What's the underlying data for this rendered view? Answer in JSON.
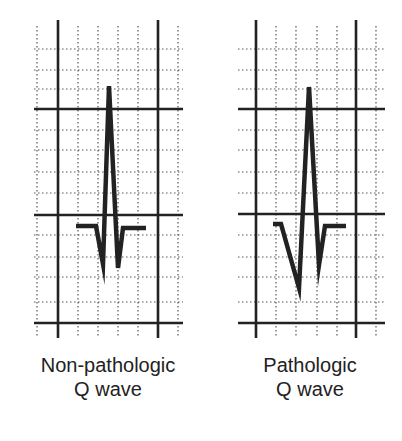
{
  "figure": {
    "colors": {
      "line": "#222222",
      "grid": "#555555",
      "background": "#ffffff"
    },
    "panels": [
      {
        "id": "non-pathologic",
        "label_line1": "Non-pathologic",
        "label_line2": "Q wave",
        "grid": {
          "thick_vertical_x": [
            58,
            158
          ],
          "thick_horizontal_y": [
            109,
            215,
            323
          ],
          "dotted_vertical_x": [
            37,
            78,
            98,
            118,
            138,
            178
          ],
          "dotted_horizontal_y": [
            49,
            70,
            89,
            130,
            150,
            172,
            193,
            235,
            257,
            277,
            302
          ],
          "x_range": [
            34,
            183
          ],
          "y_range": [
            20,
            338
          ]
        },
        "waveform": [
          [
            76,
            226
          ],
          [
            96,
            226
          ],
          [
            103,
            264
          ],
          [
            109,
            86
          ],
          [
            118,
            268
          ],
          [
            123,
            228
          ],
          [
            146,
            228
          ]
        ]
      },
      {
        "id": "pathologic",
        "label_line1": "Pathologic",
        "label_line2": "Q wave",
        "grid": {
          "thick_vertical_x": [
            256,
            356
          ],
          "thick_horizontal_y": [
            109,
            214,
            323
          ],
          "dotted_vertical_x": [
            276,
            296,
            317,
            337,
            376
          ],
          "dotted_horizontal_y": [
            49,
            70,
            89,
            130,
            150,
            172,
            193,
            235,
            257,
            277,
            302
          ],
          "x_range": [
            238,
            385
          ],
          "y_range": [
            20,
            338
          ]
        },
        "waveform": [
          [
            273,
            224
          ],
          [
            281,
            224
          ],
          [
            299,
            288
          ],
          [
            309,
            87
          ],
          [
            319,
            265
          ],
          [
            325,
            226
          ],
          [
            346,
            226
          ]
        ]
      }
    ]
  }
}
